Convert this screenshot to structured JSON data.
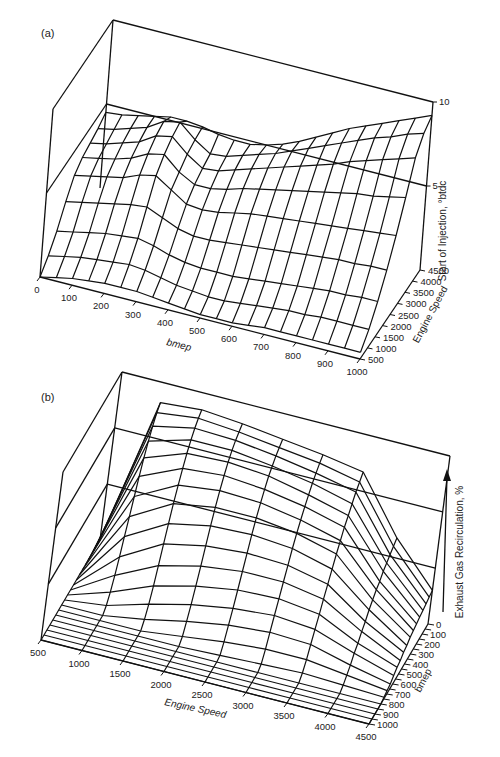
{
  "chart_data": [
    {
      "type": "surface",
      "panel_label": "(a)",
      "title": "",
      "xlabel": "bmep",
      "ylabel": "Engine Speed",
      "zlabel": "Start of Injection, °btdc",
      "x_ticks": [
        "0",
        "100",
        "200",
        "300",
        "400",
        "500",
        "600",
        "700",
        "800",
        "900",
        "1000"
      ],
      "y_ticks": [
        "500",
        "1000",
        "1500",
        "2000",
        "2500",
        "3000",
        "3500",
        "4000",
        "4500"
      ],
      "z_ticks": [
        "5",
        "10"
      ],
      "xlim": [
        0,
        1000
      ],
      "ylim": [
        500,
        4500
      ],
      "zlim": [
        0,
        10
      ],
      "x": [
        0,
        50,
        100,
        150,
        200,
        250,
        300,
        350,
        400,
        450,
        500,
        550,
        600,
        650,
        700,
        750,
        800,
        850,
        900,
        950,
        1000
      ],
      "y": [
        500,
        1000,
        1500,
        2000,
        2500,
        3000,
        3500,
        4000,
        4500
      ],
      "z": [
        [
          0.0,
          0.2,
          0.4,
          0.5,
          0.6,
          0.6,
          0.6,
          0.5,
          0.4,
          0.3,
          0.2,
          0.2,
          0.2,
          0.3,
          0.4,
          0.4,
          0.4,
          0.4,
          0.4,
          0.4,
          0.4
        ],
        [
          0.6,
          0.8,
          1.0,
          1.1,
          1.2,
          1.3,
          1.2,
          1.0,
          0.8,
          0.7,
          0.6,
          0.6,
          0.7,
          0.8,
          0.9,
          1.0,
          1.0,
          1.1,
          1.1,
          1.1,
          1.1
        ],
        [
          1.4,
          1.6,
          1.8,
          2.0,
          2.1,
          2.2,
          2.0,
          1.7,
          1.5,
          1.4,
          1.4,
          1.4,
          1.5,
          1.6,
          1.7,
          1.8,
          1.9,
          2.0,
          2.0,
          2.1,
          2.1
        ],
        [
          2.5,
          2.7,
          2.9,
          3.1,
          3.3,
          3.4,
          3.0,
          2.6,
          2.4,
          2.4,
          2.5,
          2.6,
          2.7,
          2.8,
          2.9,
          3.0,
          3.1,
          3.2,
          3.2,
          3.3,
          3.3
        ],
        [
          3.4,
          3.6,
          3.8,
          4.0,
          4.4,
          4.6,
          4.0,
          3.4,
          3.3,
          3.4,
          3.6,
          3.8,
          3.9,
          4.0,
          4.1,
          4.2,
          4.3,
          4.4,
          4.5,
          4.6,
          4.7
        ],
        [
          3.8,
          4.0,
          4.2,
          4.5,
          5.0,
          5.2,
          4.4,
          3.9,
          3.9,
          4.1,
          4.4,
          4.6,
          4.8,
          5.0,
          5.2,
          5.4,
          5.6,
          5.8,
          5.9,
          6.1,
          6.3
        ],
        [
          4.0,
          4.2,
          4.5,
          4.8,
          5.4,
          5.6,
          4.8,
          4.2,
          4.3,
          4.6,
          4.9,
          5.2,
          5.5,
          5.8,
          6.1,
          6.4,
          6.8,
          7.1,
          7.4,
          7.7,
          8.0
        ],
        [
          4.2,
          4.4,
          4.7,
          5.0,
          5.6,
          5.8,
          5.0,
          4.4,
          4.5,
          4.8,
          5.1,
          5.4,
          5.8,
          6.2,
          6.6,
          7.0,
          7.4,
          7.8,
          8.1,
          8.5,
          8.8
        ],
        [
          4.5,
          4.6,
          4.8,
          5.0,
          5.2,
          5.2,
          5.1,
          4.9,
          4.8,
          4.8,
          5.0,
          5.3,
          5.7,
          6.2,
          6.7,
          7.2,
          7.6,
          8.0,
          8.4,
          8.8,
          9.2
        ]
      ]
    },
    {
      "type": "surface",
      "panel_label": "(b)",
      "title": "",
      "xlabel": "Engine Speed",
      "ylabel": "bmep",
      "zlabel": "Exhaust Gas Recirculation, %",
      "x_ticks": [
        "500",
        "1000",
        "1500",
        "2000",
        "2500",
        "3000",
        "3500",
        "4000",
        "4500"
      ],
      "y_ticks": [
        "0",
        "100",
        "200",
        "300",
        "400",
        "500",
        "600",
        "700",
        "800",
        "900",
        "1000"
      ],
      "z_ticks": [],
      "xlim": [
        500,
        4500
      ],
      "ylim": [
        0,
        1000
      ],
      "zlim": [
        0,
        100
      ],
      "x": [
        500,
        1000,
        1500,
        2000,
        2500,
        3000,
        3500,
        4000,
        4500
      ],
      "y": [
        0,
        50,
        100,
        150,
        200,
        250,
        300,
        350,
        400,
        450,
        500,
        550,
        600,
        650,
        700,
        750,
        800,
        850,
        900,
        950,
        1000
      ],
      "z": [
        [
          0,
          88,
          90,
          88,
          85,
          82,
          78,
          45,
          20
        ],
        [
          0,
          85,
          88,
          86,
          83,
          80,
          75,
          43,
          19
        ],
        [
          0,
          80,
          85,
          84,
          81,
          77,
          72,
          41,
          18
        ],
        [
          0,
          74,
          81,
          81,
          78,
          74,
          68,
          39,
          17
        ],
        [
          0,
          67,
          76,
          77,
          75,
          70,
          64,
          37,
          16
        ],
        [
          0,
          59,
          70,
          72,
          70,
          66,
          60,
          34,
          15
        ],
        [
          0,
          50,
          63,
          66,
          65,
          61,
          55,
          32,
          14
        ],
        [
          0,
          41,
          55,
          59,
          59,
          56,
          50,
          29,
          13
        ],
        [
          0,
          32,
          46,
          51,
          52,
          50,
          44,
          26,
          11
        ],
        [
          0,
          23,
          37,
          42,
          44,
          43,
          38,
          22,
          10
        ],
        [
          0,
          15,
          27,
          33,
          36,
          36,
          32,
          19,
          8
        ],
        [
          0,
          8,
          18,
          24,
          28,
          29,
          26,
          15,
          7
        ],
        [
          0,
          3,
          10,
          16,
          20,
          22,
          20,
          12,
          5
        ],
        [
          0,
          0,
          4,
          9,
          13,
          15,
          14,
          8,
          3
        ],
        [
          0,
          0,
          0,
          3,
          6,
          8,
          8,
          5,
          2
        ],
        [
          0,
          0,
          0,
          0,
          1,
          2,
          3,
          2,
          1
        ],
        [
          0,
          0,
          0,
          0,
          0,
          0,
          0,
          0,
          0
        ],
        [
          0,
          0,
          0,
          0,
          0,
          0,
          0,
          0,
          0
        ],
        [
          0,
          0,
          0,
          0,
          0,
          0,
          0,
          0,
          0
        ],
        [
          0,
          0,
          0,
          0,
          0,
          0,
          0,
          0,
          0
        ],
        [
          0,
          0,
          0,
          0,
          0,
          0,
          0,
          0,
          0
        ]
      ]
    }
  ]
}
